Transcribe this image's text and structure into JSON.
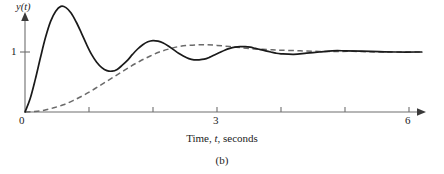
{
  "figure": {
    "caption": "(b)"
  },
  "axes": {
    "y_title": "y(t)",
    "x_title_prefix": "Time, ",
    "x_title_var": "t",
    "x_title_suffix": ", seconds",
    "y_tick_labels": [
      "0",
      "1"
    ],
    "x_tick_labels": [
      "0",
      "3",
      "6"
    ]
  },
  "chart_data": {
    "type": "line",
    "title": "",
    "subtitle": "",
    "xlabel": "Time, t, seconds",
    "ylabel": "y(t)",
    "xlim": [
      0,
      6.3
    ],
    "ylim": [
      0,
      1.85
    ],
    "grid": false,
    "legend": "none",
    "x_ticks": [
      0,
      1,
      2,
      3,
      4,
      5,
      6
    ],
    "x_tick_labels_shown": {
      "0": "0",
      "3": "3",
      "6": "6"
    },
    "y_ticks": [
      1
    ],
    "y_tick_labels_shown": {
      "1": "1"
    },
    "annotations": [
      "(b)"
    ],
    "series": [
      {
        "name": "underdamped-response",
        "style": "solid",
        "color": "#1a1a1a",
        "steady_state": 1.0,
        "x": [
          0.0,
          0.08,
          0.16,
          0.24,
          0.32,
          0.4,
          0.48,
          0.56,
          0.64,
          0.72,
          0.8,
          0.88,
          0.96,
          1.04,
          1.12,
          1.2,
          1.28,
          1.36,
          1.44,
          1.52,
          1.6,
          1.68,
          1.76,
          1.84,
          1.92,
          2.0,
          2.08,
          2.16,
          2.24,
          2.32,
          2.4,
          2.48,
          2.56,
          2.64,
          2.72,
          2.8,
          2.88,
          2.96,
          3.04,
          3.12,
          3.2,
          3.28,
          3.36,
          3.44,
          3.52,
          3.6,
          3.68,
          3.76,
          3.84,
          3.92,
          4.0,
          4.2,
          4.4,
          4.6,
          4.8,
          5.0,
          5.4,
          5.8,
          6.2
        ],
        "y": [
          0.0,
          0.22,
          0.54,
          0.9,
          1.24,
          1.51,
          1.68,
          1.76,
          1.74,
          1.65,
          1.5,
          1.32,
          1.13,
          0.96,
          0.83,
          0.74,
          0.69,
          0.68,
          0.71,
          0.78,
          0.86,
          0.96,
          1.05,
          1.12,
          1.17,
          1.19,
          1.18,
          1.15,
          1.1,
          1.04,
          0.98,
          0.93,
          0.89,
          0.87,
          0.87,
          0.88,
          0.91,
          0.95,
          0.99,
          1.03,
          1.06,
          1.08,
          1.09,
          1.09,
          1.08,
          1.06,
          1.04,
          1.02,
          1.0,
          0.98,
          0.97,
          0.96,
          0.98,
          1.0,
          1.02,
          1.02,
          1.01,
          1.0,
          1.0
        ]
      },
      {
        "name": "overdamped-response",
        "style": "dashed",
        "color": "#6a6a6a",
        "steady_state": 1.0,
        "x": [
          0.0,
          0.15,
          0.3,
          0.45,
          0.6,
          0.75,
          0.9,
          1.05,
          1.2,
          1.35,
          1.5,
          1.65,
          1.8,
          1.95,
          2.1,
          2.25,
          2.4,
          2.55,
          2.7,
          2.85,
          3.0,
          3.2,
          3.4,
          3.6,
          3.8,
          4.0,
          4.3,
          4.6,
          4.9,
          5.2,
          5.5,
          5.8,
          6.2
        ],
        "y": [
          0.0,
          0.01,
          0.03,
          0.07,
          0.12,
          0.19,
          0.27,
          0.36,
          0.46,
          0.56,
          0.66,
          0.76,
          0.85,
          0.93,
          1.0,
          1.05,
          1.09,
          1.11,
          1.12,
          1.12,
          1.11,
          1.09,
          1.07,
          1.05,
          1.04,
          1.03,
          1.02,
          1.01,
          1.01,
          1.01,
          1.0,
          1.0,
          1.0
        ]
      }
    ]
  }
}
